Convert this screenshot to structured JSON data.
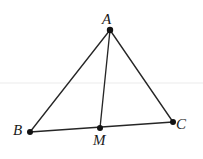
{
  "figure": {
    "background_color": "#ffffff",
    "stroke_color": "#262626",
    "dot_color": "#121212",
    "label_color": "#1a1a1a",
    "width": 203,
    "height": 159,
    "points": {
      "A": {
        "label": "A",
        "x": 110,
        "y": 30
      },
      "B": {
        "label": "B",
        "x": 30,
        "y": 132
      },
      "C": {
        "label": "C",
        "x": 173,
        "y": 122
      },
      "M": {
        "label": "M",
        "x": 100,
        "y": 128
      }
    },
    "segments": [
      {
        "name": "AB",
        "from": "A",
        "to": "B"
      },
      {
        "name": "AC",
        "from": "A",
        "to": "C"
      },
      {
        "name": "BC",
        "from": "B",
        "to": "C"
      },
      {
        "name": "AM",
        "from": "A",
        "to": "M"
      }
    ]
  }
}
